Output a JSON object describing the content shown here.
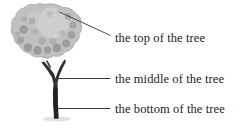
{
  "diagram": {
    "subject": "tree",
    "background_color": "#ffffff",
    "text_color": "#231f20",
    "leader_line_color": "#3a3a3a",
    "illustration": {
      "name": "tree-illustration",
      "canopy": {
        "name": "tree-canopy",
        "base_color": "#b8b8b8",
        "highlight_color": "#d2d2d2",
        "spot_color": "#8a8a8a",
        "outline_color": "#9a9a9a"
      },
      "trunk": {
        "name": "tree-trunk",
        "color": "#2e2e2e",
        "branch_color": "#3c3c3c"
      },
      "shadow": {
        "name": "ground-shadow",
        "color": "#d8d8d8"
      }
    },
    "labels": [
      {
        "id": "top",
        "text": "the top of the tree",
        "leader_line": "diagonal"
      },
      {
        "id": "middle",
        "text": "the middle of the tree",
        "leader_line": "horizontal"
      },
      {
        "id": "bottom",
        "text": "the bottom of the tree",
        "leader_line": "horizontal"
      }
    ]
  }
}
